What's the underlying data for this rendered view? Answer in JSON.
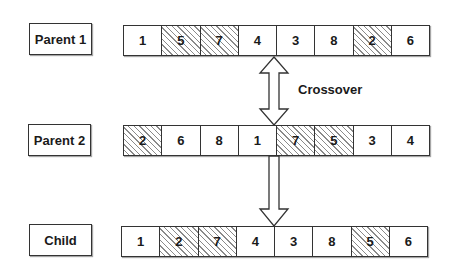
{
  "diagram": {
    "crossover_label": "Crossover",
    "hatch_color": "#8a8a8a",
    "rows": [
      {
        "label": "Parent 1",
        "genes": [
          {
            "value": "1",
            "hatched": false
          },
          {
            "value": "5",
            "hatched": true
          },
          {
            "value": "7",
            "hatched": true
          },
          {
            "value": "4",
            "hatched": false
          },
          {
            "value": "3",
            "hatched": false
          },
          {
            "value": "8",
            "hatched": false
          },
          {
            "value": "2",
            "hatched": true
          },
          {
            "value": "6",
            "hatched": false
          }
        ]
      },
      {
        "label": "Parent 2",
        "genes": [
          {
            "value": "2",
            "hatched": true
          },
          {
            "value": "6",
            "hatched": false
          },
          {
            "value": "8",
            "hatched": false
          },
          {
            "value": "1",
            "hatched": false
          },
          {
            "value": "7",
            "hatched": true
          },
          {
            "value": "5",
            "hatched": true
          },
          {
            "value": "3",
            "hatched": false
          },
          {
            "value": "4",
            "hatched": false
          }
        ]
      },
      {
        "label": "Child",
        "genes": [
          {
            "value": "1",
            "hatched": false
          },
          {
            "value": "2",
            "hatched": true
          },
          {
            "value": "7",
            "hatched": true
          },
          {
            "value": "4",
            "hatched": false
          },
          {
            "value": "3",
            "hatched": false
          },
          {
            "value": "8",
            "hatched": false
          },
          {
            "value": "5",
            "hatched": true
          },
          {
            "value": "6",
            "hatched": false
          }
        ]
      }
    ],
    "arrows": [
      {
        "type": "double-arrow",
        "from": "Parent 1",
        "to": "Parent 2"
      },
      {
        "type": "down-arrow",
        "from": "Parent 2",
        "to": "Child"
      }
    ]
  }
}
